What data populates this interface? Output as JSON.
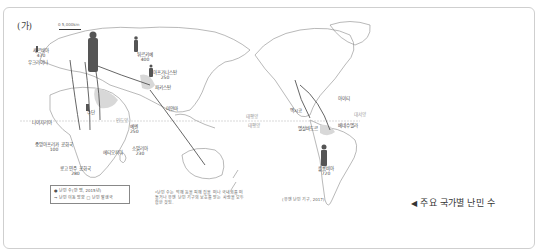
{
  "panel": {
    "label": "(가)",
    "scale_text": "0     5,000km"
  },
  "countries": [
    {
      "name": "세르비아",
      "value": "470",
      "x": 38,
      "y": 48
    },
    {
      "name": "우크라이나",
      "value": "",
      "x": 38,
      "y": 58
    },
    {
      "name": "러시아",
      "value": "",
      "x": 90,
      "y": 38
    },
    {
      "name": "튀르키예",
      "value": "400",
      "x": 140,
      "y": 55
    },
    {
      "name": "아프가니스탄",
      "value": "250",
      "x": 155,
      "y": 72
    },
    {
      "name": "파키스탄",
      "value": "",
      "x": 157,
      "y": 86
    },
    {
      "name": "수단",
      "value": "",
      "x": 91,
      "y": 110
    },
    {
      "name": "나이지리아",
      "value": "",
      "x": 41,
      "y": 121
    },
    {
      "name": "예멘",
      "value": "250",
      "x": 133,
      "y": 125
    },
    {
      "name": "중앙아프리카 공화국",
      "value": "100",
      "x": 43,
      "y": 145
    },
    {
      "name": "에티오피아",
      "value": "",
      "x": 111,
      "y": 150
    },
    {
      "name": "소말리아",
      "value": "230",
      "x": 136,
      "y": 147
    },
    {
      "name": "콩고 민주 공화국",
      "value": "280",
      "x": 68,
      "y": 170
    },
    {
      "name": "미얀마",
      "value": "",
      "x": 169,
      "y": 108
    },
    {
      "name": "멕시코",
      "value": "",
      "x": 296,
      "y": 110
    },
    {
      "name": "아이티",
      "value": "",
      "x": 340,
      "y": 98
    },
    {
      "name": "엘살바도르",
      "value": "",
      "x": 307,
      "y": 127
    },
    {
      "name": "베네수엘라",
      "value": "",
      "x": 340,
      "y": 125
    },
    {
      "name": "콜롬비아",
      "value": "720",
      "x": 326,
      "y": 155
    }
  ],
  "seas": [
    {
      "name": "인도양",
      "x": 118,
      "y": 137
    },
    {
      "name": "태평양",
      "x": 236,
      "y": 120
    },
    {
      "name": "태평양",
      "x": 252,
      "y": 128
    },
    {
      "name": "대서양",
      "x": 356,
      "y": 113
    }
  ],
  "legend": {
    "item1": "난민 수(만 명, 2015년)",
    "item2": "난민 이동 방향",
    "item3": "난민 발생국"
  },
  "note": "*난민 수는 박해 등을 피해 집을 떠나 국내외를 떠돌거나 유엔 난민 기구의 보호를 받는 사람을 모두 합한 것임.",
  "source": "(유엔 난민 기구, 2017)",
  "caption": {
    "marker": "◀",
    "text": "주요 국가별 난민 수"
  }
}
